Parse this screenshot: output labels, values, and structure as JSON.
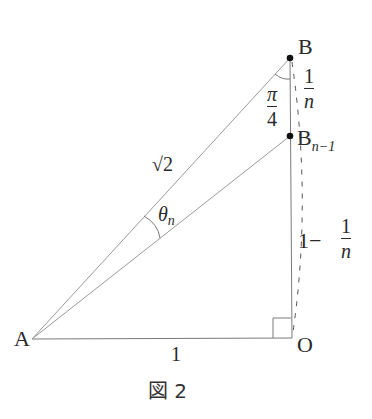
{
  "figure": {
    "caption": "図 2",
    "points": {
      "A": {
        "label": "A",
        "x": 32,
        "y": 339
      },
      "O": {
        "label": "O",
        "x": 292,
        "y": 338
      },
      "B": {
        "label": "B",
        "x": 290,
        "y": 58
      },
      "B_n_minus_1": {
        "label": "B",
        "subscript": "n−1",
        "x": 290,
        "y": 136
      }
    },
    "labels": {
      "AO_length": "1",
      "AB_length": "√2",
      "angle_at_A": {
        "symbol": "θ",
        "subscript": "n"
      },
      "angle_at_B": {
        "num": "π",
        "den": "4"
      },
      "BB_segment": {
        "num": "1",
        "den": "n"
      },
      "BnO_segment": {
        "prefix": "1−",
        "num": "1",
        "den": "n"
      }
    },
    "colors": {
      "line": "#8a8a8a",
      "text": "#2a2a2a",
      "dot": "#111111"
    }
  }
}
